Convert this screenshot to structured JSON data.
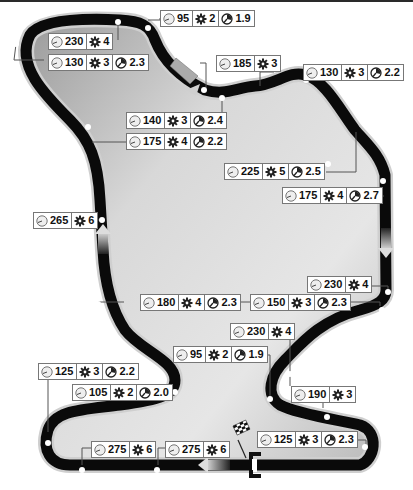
{
  "diagram": {
    "type": "race-track-map",
    "legend_icons": {
      "speed": "speedometer-icon",
      "gear": "gear-icon",
      "g_force": "g-force-gauge-icon"
    }
  },
  "corners": [
    {
      "id": "c1",
      "speed": "95",
      "gear": "2",
      "gforce": "1.9"
    },
    {
      "id": "c2",
      "speed": "230",
      "gear": "4",
      "gforce": null
    },
    {
      "id": "c3",
      "speed": "130",
      "gear": "3",
      "gforce": "2.3"
    },
    {
      "id": "c4",
      "speed": "185",
      "gear": "3",
      "gforce": null
    },
    {
      "id": "c5",
      "speed": "130",
      "gear": "3",
      "gforce": "2.2"
    },
    {
      "id": "c6",
      "speed": "140",
      "gear": "3",
      "gforce": "2.4"
    },
    {
      "id": "c7",
      "speed": "175",
      "gear": "4",
      "gforce": "2.2"
    },
    {
      "id": "c8",
      "speed": "225",
      "gear": "5",
      "gforce": "2.5"
    },
    {
      "id": "c9",
      "speed": "175",
      "gear": "4",
      "gforce": "2.7"
    },
    {
      "id": "c10",
      "speed": "265",
      "gear": "6",
      "gforce": null
    },
    {
      "id": "c11",
      "speed": "230",
      "gear": "4",
      "gforce": null
    },
    {
      "id": "c12",
      "speed": "180",
      "gear": "4",
      "gforce": "2.3"
    },
    {
      "id": "c13",
      "speed": "150",
      "gear": "3",
      "gforce": "2.3"
    },
    {
      "id": "c14",
      "speed": "230",
      "gear": "4",
      "gforce": null
    },
    {
      "id": "c15",
      "speed": "95",
      "gear": "2",
      "gforce": "1.9"
    },
    {
      "id": "c16",
      "speed": "125",
      "gear": "3",
      "gforce": "2.2"
    },
    {
      "id": "c17",
      "speed": "190",
      "gear": "3",
      "gforce": null
    },
    {
      "id": "c18",
      "speed": "105",
      "gear": "2",
      "gforce": "2.0"
    },
    {
      "id": "c19",
      "speed": "125",
      "gear": "3",
      "gforce": "2.3"
    },
    {
      "id": "c20",
      "speed": "275",
      "gear": "6",
      "gforce": null
    },
    {
      "id": "c21",
      "speed": "275",
      "gear": "6",
      "gforce": null
    }
  ],
  "markers": {
    "start_finish": "checkered-flag-icon",
    "direction_arrows": 4
  },
  "colors": {
    "track": "#0a0a0a",
    "infield": "#c8c8c8",
    "box_border": "#777777",
    "background": "#ffffff"
  }
}
